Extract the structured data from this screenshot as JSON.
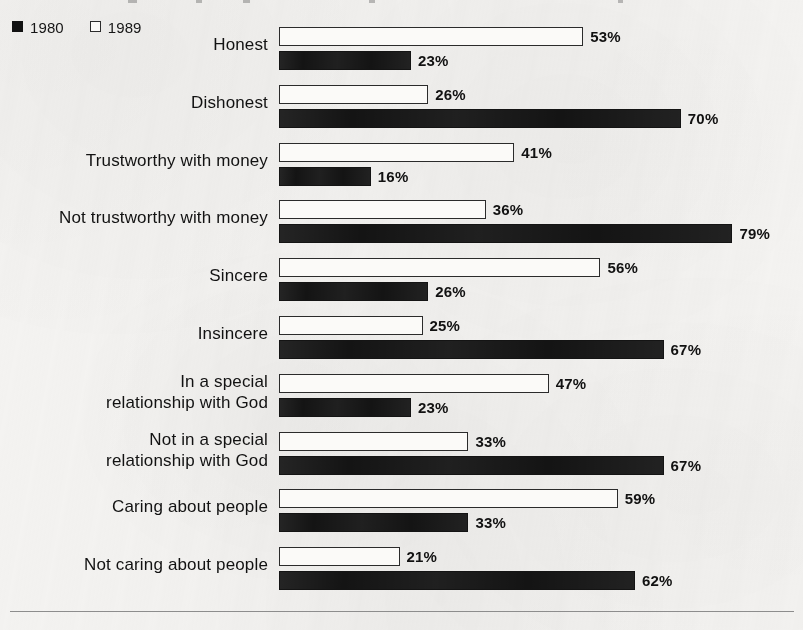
{
  "legend": {
    "entries": [
      {
        "label": "1980",
        "swatch": "filled-square-swatch",
        "color": "#121212"
      },
      {
        "label": "1989",
        "swatch": "outline-square-swatch",
        "color": "#fbfaf8"
      }
    ]
  },
  "chart_data": {
    "type": "bar",
    "orientation": "horizontal",
    "title": "",
    "xlabel": "",
    "ylabel": "",
    "xlim": [
      0,
      100
    ],
    "grid": false,
    "legend_position": "top-left",
    "value_suffix": "%",
    "categories": [
      "Honest",
      "Dishonest",
      "Trustworthy with money",
      "Not trustworthy with money",
      "Sincere",
      "Insincere",
      "In a special\nrelationship with God",
      "Not in a special\nrelationship with God",
      "Caring about people",
      "Not caring about people"
    ],
    "series": [
      {
        "name": "1980",
        "style": "outline",
        "values": [
          53,
          26,
          41,
          36,
          56,
          25,
          47,
          33,
          59,
          21
        ],
        "labels": [
          "53%",
          "26%",
          "41%",
          "36%",
          "56%",
          "25%",
          "47%",
          "33%",
          "59%",
          "21%"
        ]
      },
      {
        "name": "1989",
        "style": "filled",
        "values": [
          23,
          70,
          16,
          79,
          26,
          67,
          23,
          67,
          33,
          62
        ],
        "labels": [
          "23%",
          "70%",
          "16%",
          "79%",
          "26%",
          "67%",
          "23%",
          "67%",
          "33%",
          "62%"
        ]
      }
    ]
  }
}
